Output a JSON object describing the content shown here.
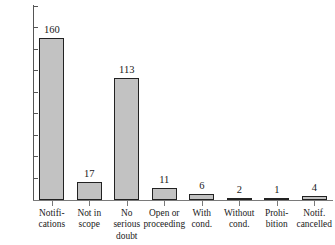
{
  "chart_data": {
    "type": "bar",
    "title": "",
    "xlabel": "",
    "ylabel": "",
    "ylim": [
      0,
      180
    ],
    "grid": false,
    "legend": false,
    "y_ticks": [
      0,
      20,
      40,
      60,
      80,
      100,
      120,
      140,
      160,
      180
    ],
    "categories": [
      "Notifications",
      "Not in scope",
      "No serious doubt",
      "Open or proceeding",
      "With cond.",
      "Without cond.",
      "Prohibition",
      "Notif. cancelled"
    ],
    "category_lines": [
      [
        "Notifi-",
        "cations"
      ],
      [
        "Not in",
        "scope"
      ],
      [
        "No",
        "serious",
        "doubt"
      ],
      [
        "Open or",
        "proceeding"
      ],
      [
        "With",
        "cond."
      ],
      [
        "Without",
        "cond."
      ],
      [
        "Prohi-",
        "bition"
      ],
      [
        "Notif.",
        "cancelled"
      ]
    ],
    "values": [
      160,
      17,
      113,
      11,
      6,
      2,
      1,
      4
    ],
    "drawn_values": [
      150,
      17,
      113,
      11,
      6,
      2,
      1,
      4
    ],
    "value_labels": [
      "160",
      "17",
      "113",
      "11",
      "6",
      "2",
      "1",
      "4"
    ],
    "bar_color": "#c2c2c2",
    "bar_edge_color": "#222222",
    "axis_color": "#555555"
  }
}
